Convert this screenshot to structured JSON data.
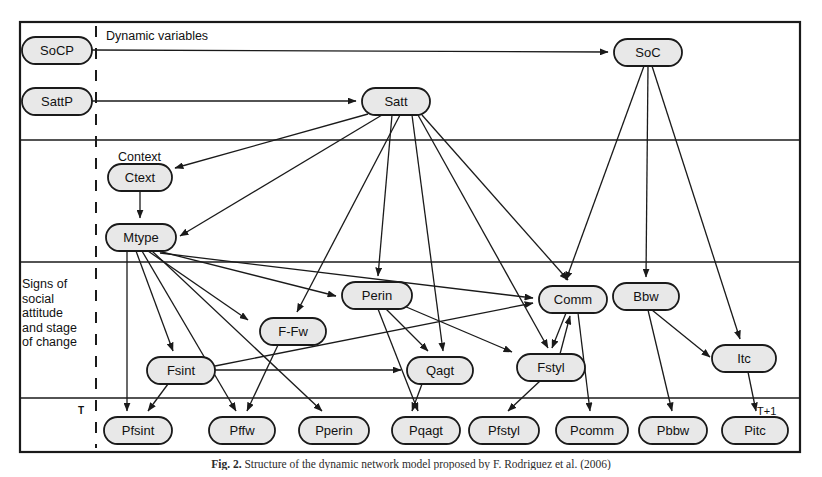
{
  "figure": {
    "caption_label": "Fig. 2.",
    "caption_text": "Structure of the dynamic network model proposed by F. Rodriguez et al. (2006)",
    "border_color": "#1a1a1a",
    "node_fill": "#e8e8e8",
    "node_stroke": "#1a1a1a",
    "edge_color": "#1a1a1a"
  },
  "bands": {
    "dynamic_variables": "Dynamic variables",
    "context": "Context",
    "signs": "Signs of\nsocial\nattitude\nand stage\nof change",
    "time_start": "T",
    "time_end": "T+1"
  },
  "nodes": [
    {
      "id": "SoCP",
      "label": "SoCP",
      "x": 22,
      "y": 37,
      "w": 70,
      "h": 27
    },
    {
      "id": "SattP",
      "label": "SattP",
      "x": 22,
      "y": 88,
      "w": 70,
      "h": 27
    },
    {
      "id": "Satt",
      "label": "Satt",
      "x": 362,
      "y": 88,
      "w": 68,
      "h": 27
    },
    {
      "id": "SoC",
      "label": "SoC",
      "x": 614,
      "y": 39,
      "w": 68,
      "h": 27
    },
    {
      "id": "Ctext",
      "label": "Ctext",
      "x": 108,
      "y": 164,
      "w": 64,
      "h": 27
    },
    {
      "id": "Mtype",
      "label": "Mtype",
      "x": 106,
      "y": 224,
      "w": 70,
      "h": 27
    },
    {
      "id": "Perin",
      "label": "Perin",
      "x": 342,
      "y": 282,
      "w": 70,
      "h": 27
    },
    {
      "id": "FFw",
      "label": "F-Fw",
      "x": 260,
      "y": 318,
      "w": 66,
      "h": 27
    },
    {
      "id": "Comm",
      "label": "Comm",
      "x": 539,
      "y": 286,
      "w": 68,
      "h": 27
    },
    {
      "id": "Bbw",
      "label": "Bbw",
      "x": 613,
      "y": 283,
      "w": 66,
      "h": 27
    },
    {
      "id": "Itc",
      "label": "Itc",
      "x": 712,
      "y": 345,
      "w": 64,
      "h": 27
    },
    {
      "id": "Fsint",
      "label": "Fsint",
      "x": 147,
      "y": 357,
      "w": 68,
      "h": 27
    },
    {
      "id": "Qagt",
      "label": "Qagt",
      "x": 407,
      "y": 357,
      "w": 66,
      "h": 27
    },
    {
      "id": "Fstyl",
      "label": "Fstyl",
      "x": 517,
      "y": 354,
      "w": 68,
      "h": 27
    },
    {
      "id": "Pfsint",
      "label": "Pfsint",
      "x": 104,
      "y": 417,
      "w": 68,
      "h": 27
    },
    {
      "id": "Pffw",
      "label": "Pffw",
      "x": 209,
      "y": 417,
      "w": 66,
      "h": 27
    },
    {
      "id": "Pperin",
      "label": "Pperin",
      "x": 299,
      "y": 417,
      "w": 70,
      "h": 27
    },
    {
      "id": "Pqagt",
      "label": "Pqagt",
      "x": 392,
      "y": 417,
      "w": 68,
      "h": 27
    },
    {
      "id": "Pfstyl",
      "label": "Pfstyl",
      "x": 469,
      "y": 417,
      "w": 70,
      "h": 27
    },
    {
      "id": "Pcomm",
      "label": "Pcomm",
      "x": 556,
      "y": 417,
      "w": 72,
      "h": 27
    },
    {
      "id": "Pbbw",
      "label": "Pbbw",
      "x": 639,
      "y": 417,
      "w": 68,
      "h": 27
    },
    {
      "id": "Pitc",
      "label": "Pitc",
      "x": 722,
      "y": 417,
      "w": 66,
      "h": 27
    }
  ],
  "edges": [
    {
      "from": "SoCP",
      "to": "SoC",
      "path": "M 92,50 L 608,52",
      "arrow": true
    },
    {
      "from": "SattP",
      "to": "Satt",
      "path": "M 92,101 L 356,101",
      "arrow": true
    },
    {
      "from": "Satt",
      "to": "Ctext",
      "path": "M 368,114 L 175,168",
      "arrow": true
    },
    {
      "from": "Satt",
      "to": "Mtype",
      "path": "M 382,115 L 180,236",
      "arrow": true
    },
    {
      "from": "Satt",
      "to": "Perin",
      "path": "M 392,115 L 378,276",
      "arrow": true
    },
    {
      "from": "Satt",
      "to": "FFw",
      "path": "M 400,115 L 297,312",
      "arrow": true
    },
    {
      "from": "Satt",
      "to": "Qagt",
      "path": "M 412,115 L 443,351",
      "arrow": true
    },
    {
      "from": "Satt",
      "to": "Comm",
      "path": "M 422,115 L 568,280",
      "arrow": true
    },
    {
      "from": "Satt",
      "to": "Fstyl",
      "path": "M 418,115 L 548,348",
      "arrow": true
    },
    {
      "from": "Ctext",
      "to": "Mtype",
      "path": "M 140,191 L 140,218",
      "arrow": true
    },
    {
      "from": "SoC",
      "to": "Bbw",
      "path": "M 648,66 L 646,277",
      "arrow": true
    },
    {
      "from": "SoC",
      "to": "Comm",
      "path": "M 644,66 L 566,280",
      "arrow": true
    },
    {
      "from": "SoC",
      "to": "Itc",
      "path": "M 652,66 L 740,339",
      "arrow": true
    },
    {
      "from": "Mtype",
      "to": "Pfsint",
      "path": "M 127,251 L 127,411",
      "arrow": true
    },
    {
      "from": "Mtype",
      "to": "Fsint",
      "path": "M 136,251 L 173,351",
      "arrow": true
    },
    {
      "from": "Mtype",
      "to": "Pffw",
      "path": "M 142,251 L 236,411",
      "arrow": true
    },
    {
      "from": "Mtype",
      "to": "FFw",
      "path": "M 148,251 L 248,320",
      "arrow": true
    },
    {
      "from": "Mtype",
      "to": "Pperin",
      "path": "M 152,251 L 322,411",
      "arrow": true
    },
    {
      "from": "Mtype",
      "to": "Perin",
      "path": "M 158,251 L 336,296",
      "arrow": true
    },
    {
      "from": "Mtype",
      "to": "Comm",
      "path": "M 160,253 L 533,298",
      "arrow": true
    },
    {
      "from": "Perin",
      "to": "Qagt",
      "path": "M 386,309 L 428,351",
      "arrow": true
    },
    {
      "from": "Perin",
      "to": "Pqagt",
      "path": "M 378,309 L 418,411",
      "arrow": true
    },
    {
      "from": "Perin",
      "to": "Fstyl",
      "path": "M 404,306 L 512,352",
      "arrow": true
    },
    {
      "from": "FFw",
      "to": "Pffw",
      "path": "M 278,345 L 247,411",
      "arrow": true
    },
    {
      "from": "Fsint",
      "to": "Qagt",
      "path": "M 215,370 L 401,370",
      "arrow": true
    },
    {
      "from": "Fsint",
      "to": "Pfsint",
      "path": "M 168,384 L 148,411",
      "arrow": true
    },
    {
      "from": "Fsint",
      "to": "Comm",
      "path": "M 215,366 L 533,303",
      "arrow": true
    },
    {
      "from": "Qagt",
      "to": "Pqagt",
      "path": "M 422,384 L 412,411",
      "arrow": true
    },
    {
      "from": "Comm",
      "to": "Fstyl",
      "path": "M 566,313 L 552,348",
      "arrow": true
    },
    {
      "from": "Fstyl",
      "to": "Comm",
      "path": "M 560,354 L 570,316",
      "arrow": true
    },
    {
      "from": "Comm",
      "to": "Pcomm",
      "path": "M 578,313 L 590,411",
      "arrow": true
    },
    {
      "from": "Fstyl",
      "to": "Pfstyl",
      "path": "M 540,381 L 508,411",
      "arrow": true
    },
    {
      "from": "Bbw",
      "to": "Itc",
      "path": "M 652,310 L 710,357",
      "arrow": true
    },
    {
      "from": "Bbw",
      "to": "Pbbw",
      "path": "M 648,310 L 672,411",
      "arrow": true
    },
    {
      "from": "Itc",
      "to": "Pitc",
      "path": "M 748,372 L 756,411",
      "arrow": true
    }
  ],
  "frame": {
    "outer": {
      "x": 20,
      "y": 22,
      "w": 780,
      "h": 430
    },
    "dividers_y": [
      140,
      262,
      398
    ],
    "dashed_x": 96
  }
}
